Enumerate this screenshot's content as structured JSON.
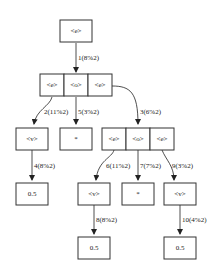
{
  "diagram": {
    "type": "tree",
    "nodes": {
      "root": {
        "label": "<e>"
      },
      "n1": {
        "cells": [
          "<e>",
          "<o>",
          "<e>"
        ]
      },
      "n2": {
        "label": "<v>"
      },
      "n5": {
        "label": "*"
      },
      "n3": {
        "cells": [
          "<e>",
          "<o>",
          "<e>"
        ]
      },
      "n4": {
        "label": "0.5"
      },
      "n6": {
        "label": "<v>"
      },
      "n7": {
        "label": "*"
      },
      "n9": {
        "label": "<v>"
      },
      "n8": {
        "label": "0.5"
      },
      "n10": {
        "label": "0.5"
      }
    },
    "edges": {
      "e1": "1(8%2)",
      "e2": "2(11%2)",
      "e5": "5(3%2)",
      "e3": "3(6%2)",
      "e4": "4(8%2)",
      "e6": "6(11%2)",
      "e7": "7(7%2)",
      "e9": "9(3%2)",
      "e8": "8(8%2)",
      "e10": "10(4%2)"
    }
  }
}
